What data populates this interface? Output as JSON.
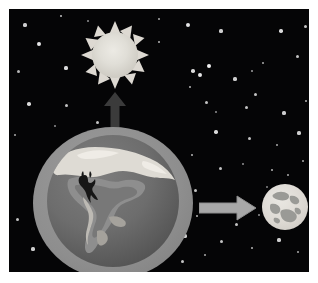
{
  "illustration": {
    "title": "Sun, Earth and Moon diagram",
    "background_color": "#050506",
    "frame_color": "#ffffff",
    "objects": [
      {
        "name": "sun",
        "label": "Sun",
        "color": "#e0ded7",
        "rays": 12
      },
      {
        "name": "earth",
        "label": "Earth",
        "color": "#6d6d6d",
        "atmosphere_color": "#8e8e8e"
      },
      {
        "name": "moon",
        "label": "Moon",
        "color": "#ddd9d3",
        "maria_color": "#9a9a96"
      },
      {
        "name": "arrow-up",
        "label": "Arrow pointing from Earth to Sun",
        "color": "#3b3b3b"
      },
      {
        "name": "arrow-right",
        "label": "Arrow pointing from Earth to Moon",
        "color": "#a8a8a8"
      }
    ],
    "stars": [
      {
        "x": 16,
        "y": 16,
        "r": 1.6,
        "o": 0.85
      },
      {
        "x": 52,
        "y": 7,
        "r": 1.4,
        "o": 0.8
      },
      {
        "x": 30,
        "y": 35,
        "r": 1.9,
        "o": 0.95
      },
      {
        "x": 9,
        "y": 62,
        "r": 1.5,
        "o": 0.75
      },
      {
        "x": 57,
        "y": 59,
        "r": 1.6,
        "o": 0.9
      },
      {
        "x": 20,
        "y": 95,
        "r": 1.8,
        "o": 0.9
      },
      {
        "x": 57,
        "y": 96,
        "r": 1.5,
        "o": 0.8
      },
      {
        "x": 88,
        "y": 113,
        "r": 1.5,
        "o": 0.8
      },
      {
        "x": 46,
        "y": 117,
        "r": 1.2,
        "o": 0.6
      },
      {
        "x": 79,
        "y": 12,
        "r": 1.2,
        "o": 0.6
      },
      {
        "x": 6,
        "y": 126,
        "r": 1.4,
        "o": 0.7
      },
      {
        "x": 8,
        "y": 210,
        "r": 1.5,
        "o": 0.8
      },
      {
        "x": 24,
        "y": 240,
        "r": 1.6,
        "o": 0.85
      },
      {
        "x": 60,
        "y": 247,
        "r": 1.3,
        "o": 0.7
      },
      {
        "x": 96,
        "y": 240,
        "r": 1.8,
        "o": 0.9
      },
      {
        "x": 120,
        "y": 254,
        "r": 1.4,
        "o": 0.75
      },
      {
        "x": 145,
        "y": 243,
        "r": 1.1,
        "o": 0.6
      },
      {
        "x": 173,
        "y": 252,
        "r": 1.5,
        "o": 0.8
      },
      {
        "x": 176,
        "y": 227,
        "r": 1.6,
        "o": 0.85
      },
      {
        "x": 196,
        "y": 246,
        "r": 1.4,
        "o": 0.7
      },
      {
        "x": 150,
        "y": 10,
        "r": 1.3,
        "o": 0.7
      },
      {
        "x": 179,
        "y": 16,
        "r": 2.0,
        "o": 0.95
      },
      {
        "x": 212,
        "y": 22,
        "r": 1.6,
        "o": 0.85
      },
      {
        "x": 150,
        "y": 33,
        "r": 1.4,
        "o": 0.75
      },
      {
        "x": 272,
        "y": 22,
        "r": 1.7,
        "o": 0.9
      },
      {
        "x": 296,
        "y": 17,
        "r": 1.5,
        "o": 0.8
      },
      {
        "x": 288,
        "y": 47,
        "r": 1.5,
        "o": 0.8
      },
      {
        "x": 254,
        "y": 54,
        "r": 1.3,
        "o": 0.7
      },
      {
        "x": 246,
        "y": 85,
        "r": 1.5,
        "o": 0.8
      },
      {
        "x": 200,
        "y": 57,
        "r": 2.3,
        "o": 1.0
      },
      {
        "x": 184,
        "y": 62,
        "r": 1.8,
        "o": 0.9
      },
      {
        "x": 191,
        "y": 66,
        "r": 1.9,
        "o": 0.95
      },
      {
        "x": 181,
        "y": 78,
        "r": 1.4,
        "o": 0.75
      },
      {
        "x": 226,
        "y": 70,
        "r": 1.6,
        "o": 0.85
      },
      {
        "x": 243,
        "y": 62,
        "r": 1.3,
        "o": 0.65
      },
      {
        "x": 197,
        "y": 93,
        "r": 1.5,
        "o": 0.8
      },
      {
        "x": 207,
        "y": 103,
        "r": 1.2,
        "o": 0.6
      },
      {
        "x": 237,
        "y": 98,
        "r": 1.5,
        "o": 0.8
      },
      {
        "x": 275,
        "y": 104,
        "r": 1.6,
        "o": 0.85
      },
      {
        "x": 297,
        "y": 92,
        "r": 1.4,
        "o": 0.75
      },
      {
        "x": 207,
        "y": 123,
        "r": 1.7,
        "o": 0.9
      },
      {
        "x": 240,
        "y": 129,
        "r": 1.5,
        "o": 0.8
      },
      {
        "x": 268,
        "y": 136,
        "r": 1.3,
        "o": 0.7
      },
      {
        "x": 290,
        "y": 124,
        "r": 1.6,
        "o": 0.85
      },
      {
        "x": 183,
        "y": 146,
        "r": 1.4,
        "o": 0.75
      },
      {
        "x": 211,
        "y": 159,
        "r": 1.5,
        "o": 0.8
      },
      {
        "x": 234,
        "y": 155,
        "r": 1.2,
        "o": 0.6
      },
      {
        "x": 263,
        "y": 161,
        "r": 1.4,
        "o": 0.75
      },
      {
        "x": 294,
        "y": 152,
        "r": 1.3,
        "o": 0.7
      },
      {
        "x": 186,
        "y": 181,
        "r": 1.5,
        "o": 0.8
      },
      {
        "x": 188,
        "y": 207,
        "r": 1.4,
        "o": 0.75
      },
      {
        "x": 214,
        "y": 199,
        "r": 1.3,
        "o": 0.7
      },
      {
        "x": 227,
        "y": 215,
        "r": 1.5,
        "o": 0.8
      },
      {
        "x": 250,
        "y": 206,
        "r": 1.2,
        "o": 0.6
      },
      {
        "x": 212,
        "y": 232,
        "r": 1.5,
        "o": 0.8
      },
      {
        "x": 243,
        "y": 239,
        "r": 1.4,
        "o": 0.75
      },
      {
        "x": 270,
        "y": 231,
        "r": 1.6,
        "o": 0.85
      },
      {
        "x": 289,
        "y": 243,
        "r": 1.3,
        "o": 0.7
      },
      {
        "x": 296,
        "y": 196,
        "r": 1.5,
        "o": 0.8
      },
      {
        "x": 258,
        "y": 178,
        "r": 1.1,
        "o": 0.55
      },
      {
        "x": 279,
        "y": 166,
        "r": 1.3,
        "o": 0.7
      },
      {
        "x": 131,
        "y": 222,
        "r": 1.2,
        "o": 0.5
      }
    ]
  }
}
